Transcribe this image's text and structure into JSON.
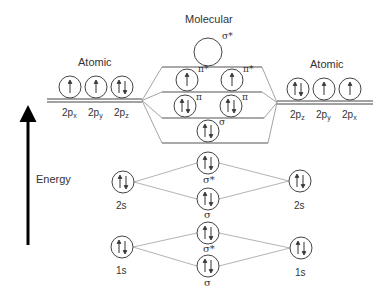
{
  "title": "Molecular",
  "left_atom": {
    "title": "Atomic",
    "orbitals_2p": [
      {
        "label": "2p",
        "sub": "x",
        "electrons": "up"
      },
      {
        "label": "2p",
        "sub": "y",
        "electrons": "up"
      },
      {
        "label": "2p",
        "sub": "z",
        "electrons": "pair"
      }
    ],
    "orbital_2s": {
      "label": "2s",
      "electrons": "pair"
    },
    "orbital_1s": {
      "label": "1s",
      "electrons": "pair"
    }
  },
  "right_atom": {
    "title": "Atomic",
    "orbitals_2p": [
      {
        "label": "2p",
        "sub": "z",
        "electrons": "pair"
      },
      {
        "label": "2p",
        "sub": "y",
        "electrons": "up"
      },
      {
        "label": "2p",
        "sub": "x",
        "electrons": "up"
      }
    ],
    "orbital_2s": {
      "label": "2s",
      "electrons": "pair"
    },
    "orbital_1s": {
      "label": "1s",
      "electrons": "pair"
    }
  },
  "molecular_orbitals": {
    "sigma_star_2p": {
      "label": "σ*",
      "electrons": "empty"
    },
    "pi_star_2p": [
      {
        "label": "π*",
        "electrons": "up"
      },
      {
        "label": "π*",
        "electrons": "up"
      }
    ],
    "pi_2p": [
      {
        "label": "π",
        "electrons": "pair"
      },
      {
        "label": "π",
        "electrons": "pair"
      }
    ],
    "sigma_2p": {
      "label": "σ",
      "electrons": "pair"
    },
    "sigma_star_2s": {
      "label": "σ*",
      "electrons": "pair"
    },
    "sigma_2s": {
      "label": "σ",
      "electrons": "pair"
    },
    "sigma_star_1s": {
      "label": "σ*",
      "electrons": "pair"
    },
    "sigma_1s": {
      "label": "σ",
      "electrons": "pair"
    }
  },
  "axis": {
    "label": "Energy"
  },
  "colors": {
    "stroke": "#333333",
    "connector": "#aaaaaa",
    "arrow": "#000000"
  }
}
